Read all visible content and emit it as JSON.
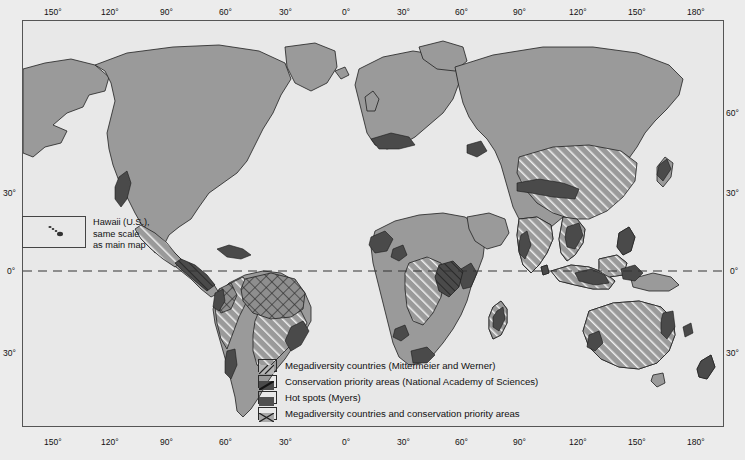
{
  "figure": {
    "kind": "world-thematic-map",
    "land_color": "#9a9a9a",
    "ocean_color": "#e8e8e8",
    "page_background": "#ececec",
    "outline_color": "#1f1f1f",
    "hotspot_color": "#4a4a4a",
    "frame_color": "#555555"
  },
  "axes": {
    "top_labels": [
      "150°",
      "120°",
      "90°",
      "60°",
      "30°",
      "0°",
      "30°",
      "60°",
      "90°",
      "120°",
      "150°",
      "180°"
    ],
    "bottom_labels": [
      "150°",
      "120°",
      "90°",
      "60°",
      "30°",
      "0°",
      "30°",
      "60°",
      "90°",
      "120°",
      "150°",
      "180°"
    ],
    "left_labels": [
      "30°",
      "0°",
      "30°"
    ],
    "right_labels": [
      "60°",
      "30°",
      "0°",
      "30°"
    ]
  },
  "equator": {
    "style": "dashed",
    "label": "0°"
  },
  "inset": {
    "title": "Hawaii (U.S.),\nsame scale\nas main map"
  },
  "legend": {
    "items": [
      {
        "pattern": "diagonal-hatch",
        "label": "Megadiversity countries (Mittermeier and Werner)"
      },
      {
        "pattern": "dark-diagonal",
        "label": "Conservation priority areas (National Academy of Sciences)"
      },
      {
        "pattern": "solid-dark",
        "label": "Hot spots (Myers)"
      },
      {
        "pattern": "cross-hatch",
        "label": "Megadiversity countries and conservation priority areas"
      }
    ]
  }
}
